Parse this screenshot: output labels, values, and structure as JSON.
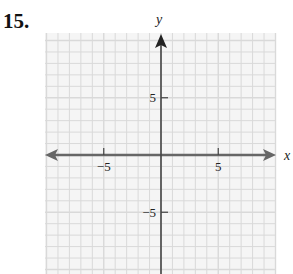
{
  "problem": {
    "number": "15."
  },
  "chart_data": {
    "type": "coordinate-grid",
    "title": "",
    "xlabel": "x",
    "ylabel": "y",
    "xlim": [
      -10,
      10
    ],
    "ylim": [
      -10,
      10
    ],
    "grid": true,
    "x_ticks": [
      {
        "value": -5,
        "label": "−5"
      },
      {
        "value": 5,
        "label": "5"
      }
    ],
    "y_ticks": [
      {
        "value": 5,
        "label": "5"
      },
      {
        "value": -5,
        "label": "−5"
      }
    ],
    "series": []
  },
  "colors": {
    "grid_line": "#d9d9d9",
    "grid_bg": "#f4f4f4",
    "axis": "#555555",
    "text": "#222222"
  }
}
